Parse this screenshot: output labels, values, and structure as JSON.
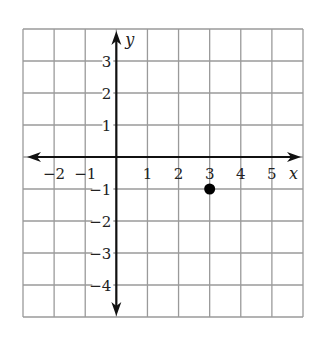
{
  "chart_data": {
    "type": "scatter",
    "title": "",
    "xlabel": "x",
    "ylabel": "y",
    "xlim": [
      -3,
      6
    ],
    "ylim": [
      -5,
      4
    ],
    "grid": true,
    "x_ticks": [
      "-2",
      "-1",
      "1",
      "2",
      "3",
      "4",
      "5"
    ],
    "y_ticks": [
      "3",
      "2",
      "1",
      "-1",
      "-2",
      "-3",
      "-4"
    ],
    "points": [
      {
        "x": 3,
        "y": -1
      }
    ]
  },
  "axes": {
    "x_label": "x",
    "y_label": "y"
  },
  "colors": {
    "grid": "#9a9a9a",
    "axis": "#111111",
    "point": "#000000"
  }
}
